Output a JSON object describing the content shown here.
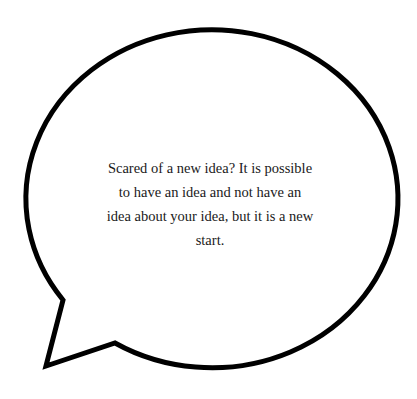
{
  "speech_bubble": {
    "text": "Scared of a new idea? It is possible to have an idea and not have an idea about your idea, but it is a new start.",
    "stroke_color": "#000000",
    "fill_color": "#ffffff"
  }
}
